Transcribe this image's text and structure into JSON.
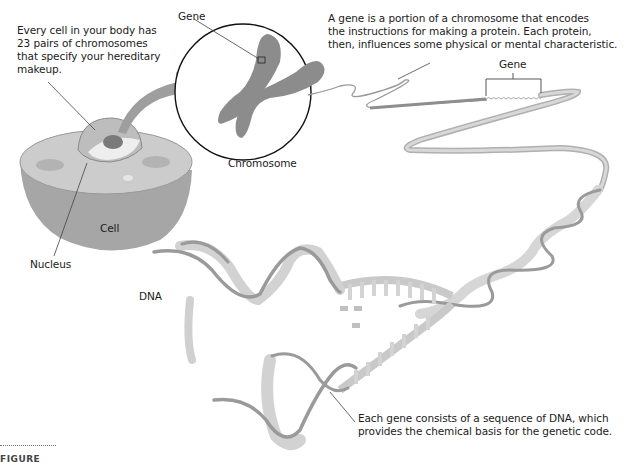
{
  "figure": {
    "labels": {
      "cell_note": [
        "Every cell in your body has",
        "23 pairs of chromosomes",
        "that specify your hereditary",
        "makeup."
      ],
      "gene_top": "Gene",
      "gene_note": [
        "A gene is a portion of a chromosome that encodes",
        "the instructions for making a protein. Each protein,",
        "then, influences some physical or mental characteristic."
      ],
      "gene_bracket": "Gene",
      "chromosome": "Chromosome",
      "cell": "Cell",
      "nucleus": "Nucleus",
      "dna": "DNA",
      "dna_note": [
        "Each gene consists of a sequence of DNA, which",
        "provides the chemical basis for the genetic code."
      ]
    },
    "footer": "FIGURE",
    "colors": {
      "cell_body": "#a3a3a3",
      "cell_top": "#cfcfcf",
      "chromosome": "#8e8e8e",
      "dna_strand": "#9a9a9a",
      "dna_rungs": "#d4d4d4",
      "leader": "#444444"
    }
  }
}
